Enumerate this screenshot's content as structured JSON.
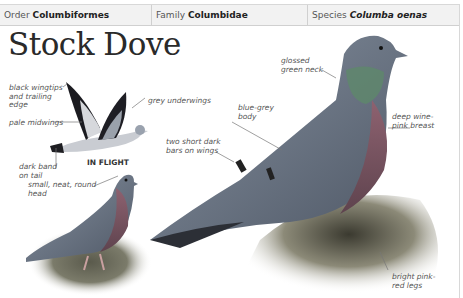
{
  "header": {
    "order_label": "Order",
    "order_value": "Columbiformes",
    "family_label": "Family",
    "family_value": "Columbidae",
    "species_label": "Species",
    "species_value": "Columba oenas"
  },
  "title": "Stock Dove",
  "in_flight_caption": "IN FLIGHT",
  "annotations": {
    "black_wingtips": "black wingtips\nand trailing\nedge",
    "pale_midwings": "pale midwings",
    "grey_underwings": "grey underwings",
    "dark_band": "dark band\non tail",
    "small_head": "small, neat, round\nhead",
    "blue_grey_body": "blue-grey\nbody",
    "two_bars": "two short dark\nbars on wings",
    "glossed_neck": "glossed\ngreen neck",
    "wine_breast": "deep wine-\npink breast",
    "pink_legs": "bright pink-\nred legs"
  },
  "colors": {
    "body": "#6f7a88",
    "breast": "#8a5a66",
    "neck": "#5d8a6a",
    "wingtip": "#1c1c22",
    "header_bg": "#f2f2f2"
  }
}
